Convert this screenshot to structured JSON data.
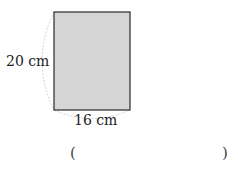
{
  "figure": {
    "shape": "rectangle",
    "height_label": "20 cm",
    "width_label": "16 cm",
    "fill_color": "#d5d5d5",
    "stroke_color": "#2a2a2a",
    "arc_color": "#cfcfcf"
  },
  "answer": {
    "open_paren": "(",
    "close_paren": ")",
    "value": ""
  }
}
